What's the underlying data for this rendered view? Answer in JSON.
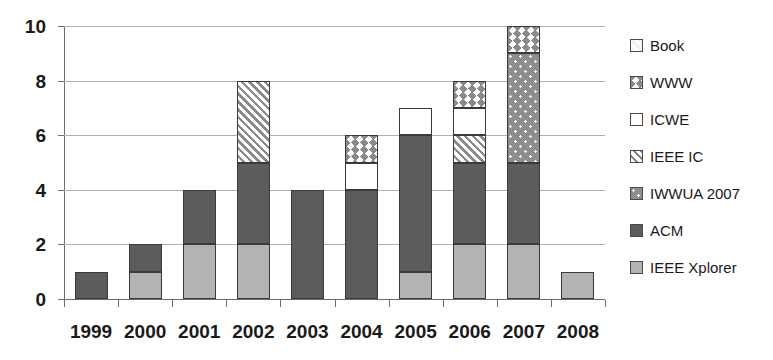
{
  "chart_data": {
    "type": "bar",
    "subtype": "stacked-bar",
    "title": "",
    "xlabel": "",
    "ylabel": "",
    "ylim": [
      0,
      10
    ],
    "y_ticks": [
      0,
      2,
      4,
      6,
      8,
      10
    ],
    "grid": true,
    "legend_position": "right",
    "categories": [
      "1999",
      "2000",
      "2001",
      "2002",
      "2003",
      "2004",
      "2005",
      "2006",
      "2007",
      "2008"
    ],
    "series": [
      {
        "name": "IEEE Xplorer",
        "pattern": "solid-light-gray",
        "color": "#b3b3b3",
        "values": [
          0,
          1,
          2,
          2,
          0,
          0,
          1,
          2,
          2,
          1
        ]
      },
      {
        "name": "ACM",
        "pattern": "solid-dark-gray",
        "color": "#5c5c5c",
        "values": [
          1,
          1,
          2,
          3,
          4,
          4,
          5,
          3,
          3,
          0
        ]
      },
      {
        "name": "IWWUA 2007",
        "pattern": "dotted-gray",
        "color": "#8e8e8e",
        "values": [
          0,
          0,
          0,
          0,
          0,
          0,
          0,
          0,
          4,
          0
        ]
      },
      {
        "name": "IEEE IC",
        "pattern": "diagonal-hatch",
        "color": "#8a8a8a",
        "values": [
          0,
          0,
          0,
          3,
          0,
          0,
          0,
          1,
          0,
          0
        ]
      },
      {
        "name": "ICWE",
        "pattern": "white-solid",
        "color": "#ffffff",
        "values": [
          0,
          0,
          0,
          0,
          0,
          1,
          1,
          1,
          0,
          0
        ]
      },
      {
        "name": "WWW",
        "pattern": "zigzag",
        "color": "#8a8a8a",
        "values": [
          0,
          0,
          0,
          0,
          0,
          1,
          0,
          1,
          1,
          0
        ]
      },
      {
        "name": "Book",
        "pattern": "light-diagonal",
        "color": "#f2f2f2",
        "values": [
          0,
          0,
          0,
          0,
          0,
          0,
          0,
          0,
          0,
          0
        ]
      }
    ],
    "totals": [
      1,
      2,
      4,
      8,
      4,
      6,
      7,
      8,
      10,
      1
    ]
  },
  "axis": {
    "y_tick_labels": [
      "10",
      "8",
      "6",
      "4",
      "2",
      "0"
    ],
    "x_tick_labels": [
      "1999",
      "2000",
      "2001",
      "2002",
      "2003",
      "2004",
      "2005",
      "2006",
      "2007",
      "2008"
    ]
  },
  "legend": {
    "items": [
      {
        "label": "Book",
        "swatch": "book-swatch-icon"
      },
      {
        "label": "WWW",
        "swatch": "www-swatch-icon"
      },
      {
        "label": "ICWE",
        "swatch": "icwe-swatch-icon"
      },
      {
        "label": "IEEE IC",
        "swatch": "ieee-ic-swatch-icon"
      },
      {
        "label": "IWWUA 2007",
        "swatch": "iwwua-swatch-icon"
      },
      {
        "label": "ACM",
        "swatch": "acm-swatch-icon"
      },
      {
        "label": "IEEE Xplorer",
        "swatch": "ieee-xplorer-swatch-icon"
      }
    ]
  }
}
